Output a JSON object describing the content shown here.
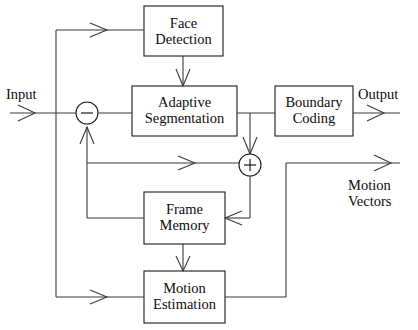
{
  "diagram": {
    "blocks": [
      {
        "id": "face_detection",
        "label": "Face\nDetection"
      },
      {
        "id": "adaptive_segmentation",
        "label": "Adaptive\nSegmentation"
      },
      {
        "id": "boundary_coding",
        "label": "Boundary\nCoding"
      },
      {
        "id": "frame_memory",
        "label": "Frame\nMemory"
      },
      {
        "id": "motion_estimation",
        "label": "Motion\nEstimation"
      }
    ],
    "io_labels": {
      "input": "Input",
      "output": "Output",
      "motion_vectors": "Motion\nVectors"
    },
    "junctions": [
      {
        "id": "subtractor",
        "sign": "−"
      },
      {
        "id": "adder",
        "sign": "+"
      }
    ],
    "colors": {
      "line": "#3a3a3a",
      "box_stroke": "#1a1a1a",
      "text": "#0d0d0d",
      "background": "#ffffff"
    }
  }
}
